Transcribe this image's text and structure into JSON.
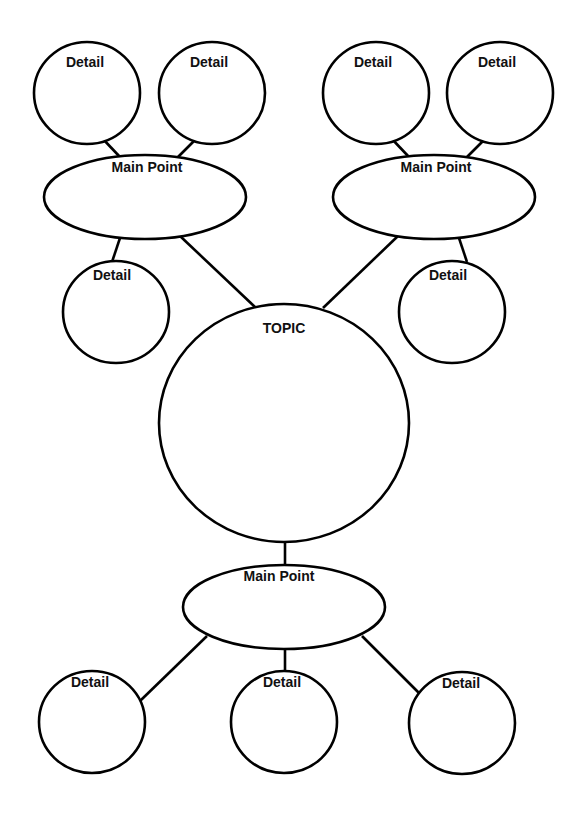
{
  "diagram": {
    "type": "bubble-map",
    "colors": {
      "stroke": "#000000",
      "text": "#111111",
      "background": "#ffffff"
    },
    "topic": {
      "label": "TOPIC"
    },
    "main_points": [
      {
        "label": "Main Point",
        "details": [
          {
            "label": "Detail"
          },
          {
            "label": "Detail"
          },
          {
            "label": "Detail"
          }
        ]
      },
      {
        "label": "Main Point",
        "details": [
          {
            "label": "Detail"
          },
          {
            "label": "Detail"
          },
          {
            "label": "Detail"
          }
        ]
      },
      {
        "label": "Main Point",
        "details": [
          {
            "label": "Detail"
          },
          {
            "label": "Detail"
          },
          {
            "label": "Detail"
          }
        ]
      }
    ]
  }
}
